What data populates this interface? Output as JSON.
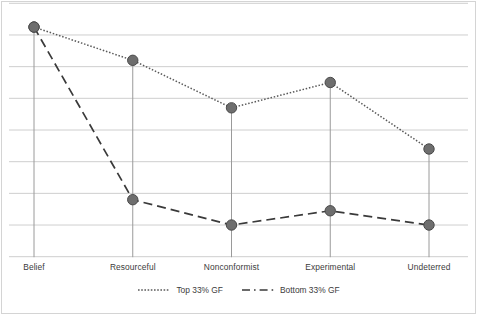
{
  "chart_data": {
    "type": "line",
    "title": "",
    "subtitle": "",
    "xlabel": "",
    "ylabel": "",
    "categories": [
      "Belief",
      "Resourceful",
      "Nonconformist",
      "Experimental",
      "Undeterred"
    ],
    "series": [
      {
        "name": "Top 33% GF",
        "style": "dotted",
        "color": "#595959",
        "marker": "circle",
        "values": [
          7.25,
          6.2,
          4.7,
          5.5,
          3.4
        ]
      },
      {
        "name": "Bottom 33% GF",
        "style": "dashed",
        "color": "#3a3a3a",
        "marker": "circle",
        "values": [
          7.25,
          1.8,
          1.0,
          1.45,
          1.0
        ]
      }
    ],
    "ylim": [
      0,
      8
    ],
    "xlim": [
      0,
      4
    ],
    "grid": "horizontal",
    "gridline_count": 9,
    "gridline_values": [
      8,
      7,
      6,
      5,
      4,
      3,
      2,
      1,
      0
    ],
    "y_tick_labels": [],
    "legend_position": "bottom-center",
    "annotations": [],
    "axis_lines": "category-verticals",
    "colors": {
      "grid": "#c8c8c8",
      "marker_fill": "#6e6e6e",
      "marker_stroke": "#4a4a4a",
      "top_series": "#595959",
      "bottom_series": "#3a3a3a",
      "frame": "#d4d4d4",
      "text": "#3c3c3c",
      "background": "#ffffff"
    }
  },
  "legend": {
    "items": [
      {
        "label": "Top 33% GF",
        "style": "dotted"
      },
      {
        "label": "Bottom 33% GF",
        "style": "dashed"
      }
    ]
  },
  "axis": {
    "x_categories": [
      "Belief",
      "Resourceful",
      "Nonconformist",
      "Experimental",
      "Undeterred"
    ]
  }
}
